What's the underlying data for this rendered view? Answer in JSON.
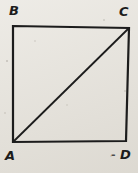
{
  "figure": {
    "vertex_labels": {
      "top_left": "B",
      "top_right": "C",
      "bottom_left": "A",
      "bottom_right": "D"
    },
    "stray_mark": "-",
    "colors": {
      "paper": "#e8e5de",
      "ink": "#1c1c1c"
    }
  }
}
